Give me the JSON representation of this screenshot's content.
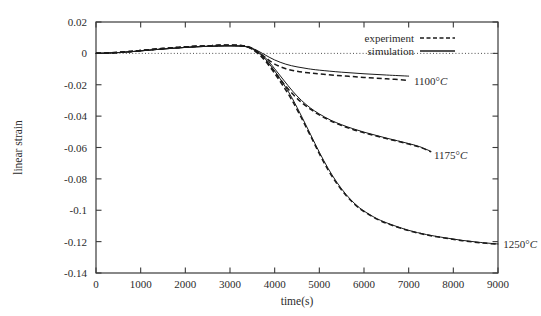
{
  "chart_data": {
    "type": "line",
    "title": "",
    "xlabel": "time(s)",
    "ylabel": "linear strain",
    "xlim": [
      0,
      9000
    ],
    "ylim": [
      -0.14,
      0.02
    ],
    "grid": false,
    "zero_reference_line": true,
    "legend_position": "top-right",
    "legend": [
      {
        "name": "experiment",
        "style": "dashed"
      },
      {
        "name": "simulation",
        "style": "solid"
      }
    ],
    "xticks": [
      0,
      1000,
      2000,
      3000,
      4000,
      5000,
      6000,
      7000,
      8000,
      9000
    ],
    "xtick_labels": [
      "0",
      "1000",
      "2000",
      "3000",
      "4000",
      "5000",
      "6000",
      "7000",
      "8000",
      "9000"
    ],
    "yticks": [
      0.02,
      0,
      -0.02,
      -0.04,
      -0.06,
      -0.08,
      -0.1,
      -0.12,
      -0.14
    ],
    "ytick_labels": [
      "0.02",
      "0",
      "-0.02",
      "-0.04",
      "-0.06",
      "-0.08",
      "-0.1",
      "-0.12",
      "-0.14"
    ],
    "annotations": [
      {
        "text": "1100°C",
        "x": 7050,
        "y": -0.0175
      },
      {
        "text": "1175°C",
        "x": 7500,
        "y": -0.0645
      },
      {
        "text": "1250°C",
        "x": 9050,
        "y": -0.1215
      }
    ],
    "series": [
      {
        "name": "1100°C simulation",
        "condition": "1100°C",
        "style": "solid",
        "x": [
          0,
          250,
          500,
          750,
          1000,
          1250,
          1500,
          1750,
          2000,
          2250,
          2500,
          2750,
          3000,
          3200,
          3350,
          3500,
          3650,
          3800,
          4000,
          4250,
          4500,
          4750,
          5000,
          5500,
          6000,
          6500,
          7000
        ],
        "y": [
          0.0,
          0.0002,
          0.0005,
          0.001,
          0.0016,
          0.0022,
          0.0028,
          0.0033,
          0.0038,
          0.0042,
          0.0045,
          0.0047,
          0.0048,
          0.0047,
          0.0044,
          0.0032,
          0.0012,
          -0.0012,
          -0.0042,
          -0.0069,
          -0.0086,
          -0.0098,
          -0.0107,
          -0.012,
          -0.013,
          -0.0138,
          -0.0145
        ]
      },
      {
        "name": "1100°C experiment",
        "condition": "1100°C",
        "style": "dashed",
        "x": [
          0,
          250,
          500,
          750,
          1000,
          1250,
          1500,
          1750,
          2000,
          2250,
          2500,
          2750,
          3000,
          3200,
          3350,
          3500,
          3650,
          3800,
          4000,
          4250,
          4500,
          4750,
          5000,
          5500,
          6000,
          6500,
          7000
        ],
        "y": [
          0.0,
          0.0002,
          0.0006,
          0.0012,
          0.0018,
          0.0025,
          0.0031,
          0.0036,
          0.0041,
          0.0045,
          0.0048,
          0.0051,
          0.0052,
          0.0051,
          0.0047,
          0.0032,
          0.0005,
          -0.0028,
          -0.0068,
          -0.0098,
          -0.0114,
          -0.0124,
          -0.0131,
          -0.0143,
          -0.0153,
          -0.0162,
          -0.0172
        ]
      },
      {
        "name": "1175°C simulation",
        "condition": "1175°C",
        "style": "solid",
        "x": [
          0,
          250,
          500,
          750,
          1000,
          1250,
          1500,
          1750,
          2000,
          2250,
          2500,
          2750,
          3000,
          3200,
          3350,
          3500,
          3650,
          3800,
          4000,
          4200,
          4400,
          4600,
          4800,
          5000,
          5250,
          5500,
          5750,
          6000,
          6250,
          6500,
          6750,
          7000,
          7250,
          7500
        ],
        "y": [
          0.0,
          0.0002,
          0.0005,
          0.001,
          0.0016,
          0.0022,
          0.0028,
          0.0033,
          0.0038,
          0.0042,
          0.0045,
          0.0047,
          0.0048,
          0.0047,
          0.0044,
          0.003,
          0.0005,
          -0.003,
          -0.0098,
          -0.017,
          -0.024,
          -0.03,
          -0.0348,
          -0.0386,
          -0.0425,
          -0.0455,
          -0.048,
          -0.0502,
          -0.0521,
          -0.054,
          -0.0557,
          -0.0575,
          -0.0595,
          -0.0625
        ]
      },
      {
        "name": "1175°C experiment",
        "condition": "1175°C",
        "style": "dashed",
        "x": [
          0,
          250,
          500,
          750,
          1000,
          1250,
          1500,
          1750,
          2000,
          2250,
          2500,
          2750,
          3000,
          3200,
          3350,
          3500,
          3650,
          3800,
          4000,
          4200,
          4400,
          4600,
          4800,
          5000,
          5250,
          5500,
          5750,
          6000,
          6250,
          6500,
          6750,
          7000,
          7250,
          7500
        ],
        "y": [
          0.0,
          0.0002,
          0.0006,
          0.0012,
          0.0018,
          0.0025,
          0.0031,
          0.0036,
          0.0041,
          0.0045,
          0.0048,
          0.0051,
          0.0052,
          0.0051,
          0.0046,
          0.0029,
          -0.0003,
          -0.0045,
          -0.0118,
          -0.0192,
          -0.0258,
          -0.0312,
          -0.0356,
          -0.0392,
          -0.043,
          -0.046,
          -0.0485,
          -0.0506,
          -0.0525,
          -0.0543,
          -0.056,
          -0.0578,
          -0.0598,
          -0.0628
        ]
      },
      {
        "name": "1250°C simulation",
        "condition": "1250°C",
        "style": "solid",
        "x": [
          0,
          250,
          500,
          750,
          1000,
          1250,
          1500,
          1750,
          2000,
          2250,
          2500,
          2750,
          3000,
          3200,
          3350,
          3500,
          3650,
          3800,
          4000,
          4200,
          4400,
          4600,
          4800,
          5000,
          5200,
          5400,
          5600,
          5800,
          6000,
          6300,
          6600,
          7000,
          7400,
          7800,
          8200,
          8600,
          9000
        ],
        "y": [
          0.0,
          0.0002,
          0.0005,
          0.001,
          0.0016,
          0.0022,
          0.0028,
          0.0033,
          0.0038,
          0.0042,
          0.0045,
          0.0047,
          0.0048,
          0.0047,
          0.0043,
          0.0028,
          0.0,
          -0.004,
          -0.0112,
          -0.0195,
          -0.029,
          -0.04,
          -0.0515,
          -0.063,
          -0.0735,
          -0.0825,
          -0.09,
          -0.096,
          -0.1005,
          -0.1055,
          -0.109,
          -0.1128,
          -0.1155,
          -0.1175,
          -0.1192,
          -0.1205,
          -0.1215
        ]
      },
      {
        "name": "1250°C experiment",
        "condition": "1250°C",
        "style": "dashed",
        "x": [
          0,
          250,
          500,
          750,
          1000,
          1250,
          1500,
          1750,
          2000,
          2250,
          2500,
          2750,
          3000,
          3200,
          3350,
          3500,
          3650,
          3800,
          4000,
          4200,
          4400,
          4600,
          4800,
          5000,
          5200,
          5400,
          5600,
          5800,
          6000,
          6300,
          6600,
          7000,
          7400,
          7800,
          8200,
          8600,
          9000
        ],
        "y": [
          0.0,
          0.0002,
          0.0006,
          0.0012,
          0.0018,
          0.0025,
          0.0031,
          0.0036,
          0.0041,
          0.0045,
          0.0048,
          0.0051,
          0.0052,
          0.005,
          0.0045,
          0.0026,
          -0.0008,
          -0.0052,
          -0.0128,
          -0.0212,
          -0.0305,
          -0.0412,
          -0.0525,
          -0.064,
          -0.0745,
          -0.0833,
          -0.0906,
          -0.0964,
          -0.1008,
          -0.1058,
          -0.1093,
          -0.113,
          -0.1157,
          -0.1177,
          -0.1194,
          -0.1207,
          -0.1217
        ]
      }
    ]
  }
}
